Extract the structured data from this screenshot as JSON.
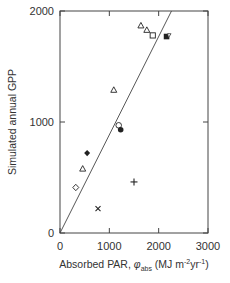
{
  "chart_data": {
    "type": "scatter",
    "title": "",
    "xlabel": "Absorbed PAR, φabs (MJ m-2yr-1)",
    "xlabel_parts": {
      "main": "Absorbed PAR, ",
      "symbol": "φ",
      "sub": "abs",
      "unit_open": " (MJ m",
      "sup1": "-2",
      "mid": "yr",
      "sup2": "-1",
      "unit_close": ")"
    },
    "ylabel": "Simulated annual GPP",
    "xlim": [
      0,
      3000
    ],
    "ylim": [
      0,
      2000
    ],
    "xticks": [
      0,
      1000,
      2000,
      3000
    ],
    "yticks": [
      0,
      1000,
      2000
    ],
    "xtick_labels": [
      "0",
      "1000",
      "2000",
      "3000"
    ],
    "ytick_labels": [
      "0",
      "1000",
      "2000"
    ],
    "grid": false,
    "legend": null,
    "points": [
      {
        "marker": "open-triangle",
        "x": 1640,
        "y": 1870
      },
      {
        "marker": "open-triangle",
        "x": 1760,
        "y": 1830
      },
      {
        "marker": "open-square",
        "x": 1880,
        "y": 1780
      },
      {
        "marker": "filled-square",
        "x": 2160,
        "y": 1770
      },
      {
        "marker": "open-triangle",
        "x": 1090,
        "y": 1290
      },
      {
        "marker": "open-circle",
        "x": 1190,
        "y": 970
      },
      {
        "marker": "filled-circle",
        "x": 1230,
        "y": 930
      },
      {
        "marker": "filled-diamond",
        "x": 550,
        "y": 720
      },
      {
        "marker": "open-triangle",
        "x": 460,
        "y": 580
      },
      {
        "marker": "open-diamond",
        "x": 320,
        "y": 410
      },
      {
        "marker": "plus",
        "x": 1500,
        "y": 460
      },
      {
        "marker": "cross",
        "x": 770,
        "y": 220
      }
    ],
    "fit_line": {
      "x": [
        0,
        2260
      ],
      "y": [
        0,
        2000
      ]
    },
    "colors": {
      "axis": "#444444",
      "marker": "#222222",
      "line": "#444444"
    }
  }
}
